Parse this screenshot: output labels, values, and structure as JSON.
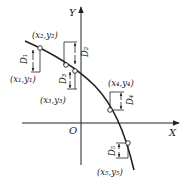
{
  "diagram": {
    "axes": {
      "x_label": "X",
      "y_label": "Y",
      "origin_label": "O"
    },
    "points": [
      {
        "id": "p1",
        "label": "(x₁,y₁)"
      },
      {
        "id": "p2",
        "label": "(x₂,y₂)"
      },
      {
        "id": "p3",
        "label": "(x₃,y₃)"
      },
      {
        "id": "p4",
        "label": "(x₄,y₄)"
      },
      {
        "id": "p5",
        "label": "(x₅,y₅)"
      }
    ],
    "distances": [
      {
        "id": "d1",
        "label": "D₁"
      },
      {
        "id": "d2",
        "label": "D₂"
      },
      {
        "id": "d3",
        "label": "D₃"
      },
      {
        "id": "d4",
        "label": "D₄"
      },
      {
        "id": "d5",
        "label": "D₅"
      }
    ],
    "colors": {
      "stroke": "#222222",
      "background": "#ffffff"
    }
  }
}
